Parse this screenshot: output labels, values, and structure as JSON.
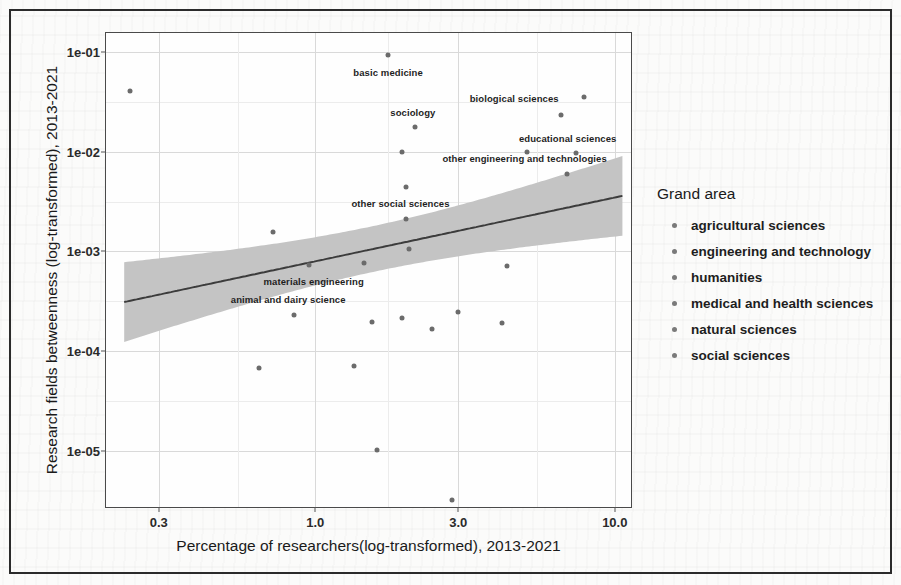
{
  "scan": {
    "frame_color": "#2b2b2b",
    "page_background": "#fbfbfa"
  },
  "axis": {
    "x_title": "Percentage of researchers(log-transformed), 2013-2021",
    "y_title": "Research fields betweenness (log-transformed), 2013-2021",
    "x_ticks": [
      "0.3",
      "1.0",
      "3.0",
      "10.0"
    ],
    "y_ticks": [
      "1e-01",
      "1e-02",
      "1e-03",
      "1e-04",
      "1e-05"
    ]
  },
  "legend": {
    "title": "Grand area",
    "items": [
      {
        "label": "agricultural sciences",
        "color": "#7a7a7a"
      },
      {
        "label": "engineering and technology",
        "color": "#7a7a7a"
      },
      {
        "label": "humanities",
        "color": "#7a7a7a"
      },
      {
        "label": "medical and health sciences",
        "color": "#7a7a7a"
      },
      {
        "label": "natural sciences",
        "color": "#7a7a7a"
      },
      {
        "label": "social sciences",
        "color": "#7a7a7a"
      }
    ]
  },
  "chart_data": {
    "type": "scatter",
    "title": "",
    "xlabel": "Percentage of researchers(log-transformed), 2013-2021",
    "ylabel": "Research fields betweenness (log-transformed), 2013-2021",
    "x_scale": "log",
    "y_scale": "log",
    "xlim": [
      0.2,
      11.5
    ],
    "ylim": [
      2.6e-06,
      0.155
    ],
    "x_tick_values": [
      0.3,
      1.0,
      3.0,
      10.0
    ],
    "y_tick_values": [
      0.1,
      0.01,
      0.001,
      0.0001,
      1e-05
    ],
    "grid": true,
    "legend_position": "right",
    "legend_title": "Grand area",
    "categories": [
      "agricultural sciences",
      "engineering and technology",
      "humanities",
      "medical and health sciences",
      "natural sciences",
      "social sciences"
    ],
    "points": [
      {
        "x": 0.24,
        "y": 0.041,
        "label": ""
      },
      {
        "x": 1.75,
        "y": 0.093,
        "label": "basic medicine",
        "label_dx": 0,
        "label_dy": 17
      },
      {
        "x": 7.9,
        "y": 0.035,
        "label": "biological sciences",
        "label_dx": -70,
        "label_dy": 1
      },
      {
        "x": 2.15,
        "y": 0.0175,
        "label": "sociology",
        "label_dx": -2,
        "label_dy": -15
      },
      {
        "x": 6.6,
        "y": 0.0235,
        "label": ""
      },
      {
        "x": 1.95,
        "y": 0.01,
        "label": ""
      },
      {
        "x": 7.4,
        "y": 0.0096,
        "label": "educational sciences",
        "label_dx": -8,
        "label_dy": -15
      },
      {
        "x": 5.1,
        "y": 0.0099,
        "label": ""
      },
      {
        "x": 6.9,
        "y": 0.006,
        "label": "other engineering and technologies",
        "label_dx": -42,
        "label_dy": -16
      },
      {
        "x": 2.0,
        "y": 0.0044,
        "label": ""
      },
      {
        "x": 2.0,
        "y": 0.0021,
        "label": "other social sciences",
        "label_dx": -5,
        "label_dy": -16
      },
      {
        "x": 0.72,
        "y": 0.00155,
        "label": ""
      },
      {
        "x": 2.05,
        "y": 0.00105,
        "label": ""
      },
      {
        "x": 0.95,
        "y": 0.00073,
        "label": "materials engineering",
        "label_dx": 5,
        "label_dy": 16
      },
      {
        "x": 1.45,
        "y": 0.00076,
        "label": ""
      },
      {
        "x": 4.35,
        "y": 0.00072,
        "label": ""
      },
      {
        "x": 0.85,
        "y": 0.00023,
        "label": "animal and dairy science",
        "label_dx": -6,
        "label_dy": -16
      },
      {
        "x": 3.0,
        "y": 0.000245,
        "label": ""
      },
      {
        "x": 1.55,
        "y": 0.000195,
        "label": ""
      },
      {
        "x": 1.95,
        "y": 0.000215,
        "label": ""
      },
      {
        "x": 2.45,
        "y": 0.000165,
        "label": ""
      },
      {
        "x": 4.2,
        "y": 0.00019,
        "label": ""
      },
      {
        "x": 1.35,
        "y": 7.1e-05,
        "label": ""
      },
      {
        "x": 0.65,
        "y": 6.8e-05,
        "label": ""
      },
      {
        "x": 1.6,
        "y": 1.02e-05,
        "label": ""
      },
      {
        "x": 2.85,
        "y": 3.2e-06,
        "label": ""
      }
    ],
    "fit_line": {
      "description": "linear fit on log-log scale with shaded 95% confidence ribbon",
      "x_start": 0.23,
      "y_start": 0.00031,
      "x_end": 10.6,
      "y_end": 0.0036,
      "ribbon_color": "#c4c4c4",
      "line_color": "#3c3c3c"
    }
  }
}
